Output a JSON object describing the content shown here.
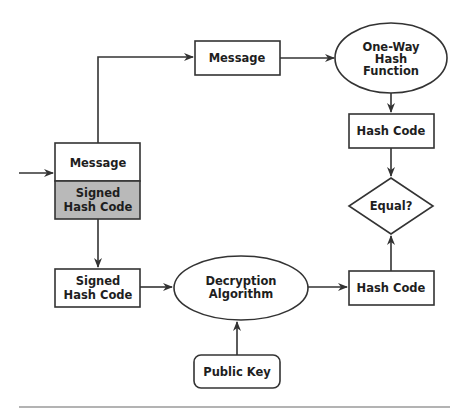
{
  "diagram": {
    "colors": {
      "stroke": "#333333",
      "text": "#1e1e1e",
      "signed_hash_fill": "#b9b9b9",
      "background": "#ffffff",
      "rule": "#9a9a9a"
    },
    "nodes": {
      "received_message": {
        "label": "Message",
        "shape": "rectangle"
      },
      "received_signed_hash": {
        "line1": "Signed",
        "line2": "Hash Code",
        "shape": "rectangle",
        "fill": "gray"
      },
      "message": {
        "label": "Message",
        "shape": "rectangle"
      },
      "hash_function": {
        "line1": "One-Way",
        "line2": "Hash",
        "line3": "Function",
        "shape": "ellipse"
      },
      "hash_code_computed": {
        "label": "Hash Code",
        "shape": "rectangle"
      },
      "equal": {
        "label": "Equal?",
        "shape": "diamond"
      },
      "signed_hash": {
        "line1": "Signed",
        "line2": "Hash Code",
        "shape": "rectangle"
      },
      "decryption": {
        "line1": "Decryption",
        "line2": "Algorithm",
        "shape": "ellipse"
      },
      "hash_code_decrypted": {
        "label": "Hash Code",
        "shape": "rectangle"
      },
      "public_key": {
        "label": "Public Key",
        "shape": "rounded-rectangle"
      }
    },
    "edges": [
      {
        "from": "input",
        "to": "received_message"
      },
      {
        "from": "received_message",
        "to": "message"
      },
      {
        "from": "message",
        "to": "hash_function"
      },
      {
        "from": "hash_function",
        "to": "hash_code_computed"
      },
      {
        "from": "hash_code_computed",
        "to": "equal"
      },
      {
        "from": "received_signed_hash",
        "to": "signed_hash"
      },
      {
        "from": "signed_hash",
        "to": "decryption"
      },
      {
        "from": "public_key",
        "to": "decryption"
      },
      {
        "from": "decryption",
        "to": "hash_code_decrypted"
      },
      {
        "from": "hash_code_decrypted",
        "to": "equal"
      }
    ]
  }
}
